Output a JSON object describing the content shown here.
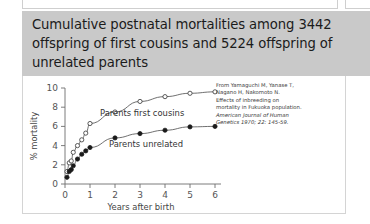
{
  "slide": {
    "title": "Cumulative postnatal mortalities among 3442 offspring of first cousins and 5224 offspring of unrelated parents",
    "title_band_color": "#c9c9c9",
    "background_color": "#ffffff"
  },
  "caption": {
    "line1": "From Yamaguchi M, Yanase T,",
    "line2": "Nagano H, Nakomoto N.",
    "line3": "Effects of inbreeding on",
    "line4": "mortality in Fukuoka population.",
    "line5": "American Journal of Human",
    "line6": "Genetics 1970; 22: 145-59."
  },
  "chart_data": {
    "type": "line",
    "title": "",
    "xlabel": "Years after birth",
    "ylabel": "% mortality",
    "xlim": [
      0,
      6.4
    ],
    "ylim": [
      0,
      10
    ],
    "xticks": [
      "0",
      "1",
      "2",
      "3",
      "4",
      "5",
      "6"
    ],
    "yticks": [
      "0",
      "2",
      "4",
      "6",
      "8",
      "10"
    ],
    "grid": false,
    "legend_position": "inline-annotation",
    "series": [
      {
        "name": "Parents first cousins",
        "marker": "open-circle",
        "x": [
          0.08,
          0.17,
          0.25,
          0.33,
          0.5,
          0.67,
          0.83,
          1.0,
          2.0,
          3.0,
          4.0,
          5.0,
          6.0
        ],
        "values": [
          1.3,
          2.2,
          2.4,
          3.3,
          4.0,
          4.6,
          5.3,
          6.3,
          7.5,
          8.6,
          9.1,
          9.45,
          9.6
        ]
      },
      {
        "name": "Parents unrelated",
        "marker": "filled-circle",
        "x": [
          0.08,
          0.17,
          0.25,
          0.33,
          0.5,
          0.67,
          0.83,
          1.0,
          2.0,
          3.0,
          4.0,
          5.0,
          6.0
        ],
        "values": [
          0.7,
          1.3,
          1.5,
          1.9,
          2.6,
          3.1,
          3.45,
          3.8,
          4.8,
          5.25,
          5.6,
          5.95,
          6.0
        ]
      }
    ]
  }
}
